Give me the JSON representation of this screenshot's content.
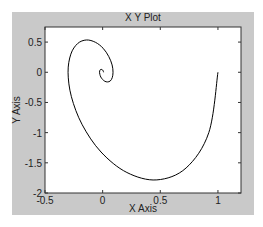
{
  "chart_data": {
    "type": "line",
    "title": "X Y Plot",
    "xlabel": "X Axis",
    "ylabel": "Y Axis",
    "xlim": [
      -0.5,
      1.2
    ],
    "ylim": [
      -2,
      0.75
    ],
    "xticks": [
      -0.5,
      0,
      0.5,
      1
    ],
    "xtick_labels": [
      "-0.5",
      "0",
      "0.5",
      "1"
    ],
    "yticks": [
      -2,
      -1.5,
      -1,
      -0.5,
      0,
      0.5
    ],
    "ytick_labels": [
      "-2",
      "-1.5",
      "-1",
      "-0.5",
      "0",
      "0.5"
    ],
    "grid": false,
    "legend": null,
    "series": [
      {
        "name": "trajectory",
        "color": "#000000",
        "x": [
          1.0,
          0.921,
          0.724,
          0.47,
          0.21,
          -0.014,
          -0.177,
          -0.271,
          -0.3,
          -0.276,
          -0.217,
          -0.141,
          -0.063,
          0.004,
          0.053,
          0.082,
          0.09,
          0.083,
          0.066,
          0.042,
          0.019,
          -0.001,
          -0.016,
          -0.024,
          -0.027,
          -0.025,
          -0.02,
          -0.013,
          -0.006,
          0.0,
          0.005,
          0.008
        ],
        "y": [
          0.0,
          -0.998,
          -1.585,
          -1.783,
          -1.66,
          -1.321,
          -0.87,
          -0.405,
          0.0,
          0.3,
          0.476,
          0.535,
          0.497,
          0.398,
          0.261,
          0.122,
          0.0,
          -0.09,
          -0.144,
          -0.16,
          -0.149,
          -0.118,
          -0.079,
          -0.036,
          0.0,
          0.027,
          0.043,
          0.048,
          0.045,
          0.036,
          0.024,
          0.0
        ]
      }
    ]
  },
  "colors": {
    "figure_background": "#c9c9c9",
    "axes_background": "#ffffff",
    "line": "#000000"
  }
}
